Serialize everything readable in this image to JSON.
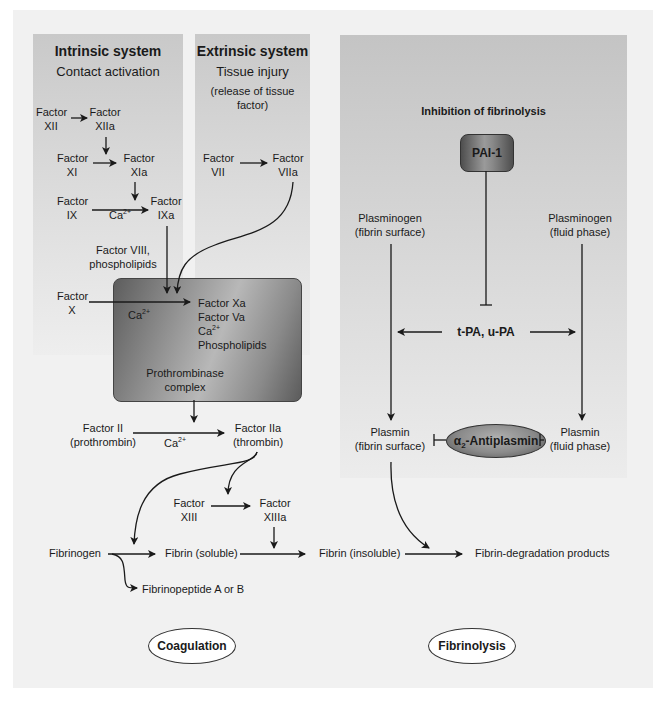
{
  "panels": {
    "intrinsic": {
      "title": "Intrinsic system",
      "subtitle": "Contact activation",
      "nodes": {
        "f12": [
          "Factor",
          "XII"
        ],
        "f12a": [
          "Factor",
          "XIIa"
        ],
        "f11": [
          "Factor",
          "XI"
        ],
        "f11a": [
          "Factor",
          "XIa"
        ],
        "f9": [
          "Factor",
          "IX"
        ],
        "f9a": [
          "Factor",
          "IXa"
        ],
        "ca_9": "Ca",
        "f8": [
          "Factor VIII,",
          "phospholipids"
        ]
      }
    },
    "extrinsic": {
      "title": "Extrinsic system",
      "subtitle": "Tissue injury",
      "note": [
        "(release of tissue",
        "factor)"
      ],
      "nodes": {
        "f7": [
          "Factor",
          "VII"
        ],
        "f7a": [
          "Factor",
          "VIIa"
        ]
      }
    },
    "fibrinolysis": {
      "title": "Inhibition of fibrinolysis",
      "pai": "PAI-1",
      "plasminogen_surface": [
        "Plasminogen",
        "(fibrin surface)"
      ],
      "plasminogen_fluid": [
        "Plasminogen",
        "(fluid phase)"
      ],
      "activators": "t-PA, u-PA",
      "plasmin_surface": [
        "Plasmin",
        "(fibrin surface)"
      ],
      "plasmin_fluid": [
        "Plasmin",
        "(fluid phase)"
      ],
      "antiplasmin_prefix": "α",
      "antiplasmin_sub": "2",
      "antiplasmin_name": "-Antiplasmin"
    }
  },
  "prothrombinase": {
    "factor_x": [
      "Factor",
      "X"
    ],
    "ca": "Ca",
    "components": [
      "Factor Xa",
      "Factor Va",
      "Ca",
      "Phospholipids"
    ],
    "label": [
      "Prothrombinase",
      "complex"
    ]
  },
  "common": {
    "f2": [
      "Factor II",
      "(prothrombin)"
    ],
    "ca_2": "Ca",
    "f2a": [
      "Factor IIa",
      "(thrombin)"
    ],
    "f13": [
      "Factor",
      "XIII"
    ],
    "f13a": [
      "Factor",
      "XIIIa"
    ],
    "fibrinogen": "Fibrinogen",
    "fibrin_soluble": "Fibrin (soluble)",
    "fibrin_insoluble": "Fibrin (insoluble)",
    "fdp": "Fibrin-degradation products",
    "fibrinopeptide": "Fibrinopeptide A or B",
    "superscript": "2+"
  },
  "legend": {
    "coagulation": "Coagulation",
    "fibrinolysis": "Fibrinolysis"
  },
  "colors": {
    "panel_gray": "#c9c9c9",
    "canvas": "#f1f1f1",
    "line": "#1a1a1a"
  }
}
